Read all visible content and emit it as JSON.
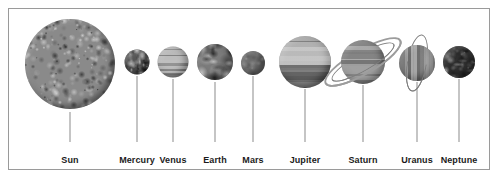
{
  "diagram": {
    "background_color": "#ffffff",
    "frame_color": "#9a9a9a",
    "label_color": "#1b1b1b",
    "leader_color": "#8c8c8c"
  },
  "bodies": [
    {
      "name": "Sun",
      "label": "Sun",
      "cx": 70,
      "cy": 64,
      "diameter": 90,
      "label_x": 70,
      "label_y": 155,
      "leader_x": 70,
      "leader_top": 112,
      "leader_height": 30,
      "base_color": "#8a8a8a",
      "texture": "granular",
      "rings": []
    },
    {
      "name": "Mercury",
      "label": "Mercury",
      "cx": 137,
      "cy": 62,
      "diameter": 25,
      "label_x": 137,
      "label_y": 155,
      "leader_x": 137,
      "leader_top": 76,
      "leader_height": 66,
      "base_color": "#565656",
      "texture": "cratered",
      "rings": []
    },
    {
      "name": "Venus",
      "label": "Venus",
      "cx": 173,
      "cy": 62,
      "diameter": 31,
      "label_x": 173,
      "label_y": 155,
      "leader_x": 173,
      "leader_top": 79,
      "leader_height": 63,
      "base_color": "#b4b4b4",
      "texture": "banded-light",
      "rings": []
    },
    {
      "name": "Earth",
      "label": "Earth",
      "cx": 215,
      "cy": 62,
      "diameter": 36,
      "label_x": 215,
      "label_y": 155,
      "leader_x": 215,
      "leader_top": 82,
      "leader_height": 60,
      "base_color": "#7b7b7b",
      "texture": "continents",
      "rings": []
    },
    {
      "name": "Mars",
      "label": "Mars",
      "cx": 253,
      "cy": 63,
      "diameter": 24,
      "label_x": 253,
      "label_y": 155,
      "leader_x": 253,
      "leader_top": 76,
      "leader_height": 66,
      "base_color": "#6d6d6d",
      "texture": "smooth",
      "rings": []
    },
    {
      "name": "Jupiter",
      "label": "Jupiter",
      "cx": 305,
      "cy": 62,
      "diameter": 52,
      "label_x": 305,
      "label_y": 155,
      "leader_x": 305,
      "leader_top": 89,
      "leader_height": 53,
      "base_color": "#9c9c9c",
      "texture": "banded-strong",
      "rings": []
    },
    {
      "name": "Saturn",
      "label": "Saturn",
      "cx": 363,
      "cy": 62,
      "diameter": 44,
      "label_x": 363,
      "label_y": 155,
      "leader_x": 363,
      "leader_top": 85,
      "leader_height": 57,
      "base_color": "#939393",
      "texture": "banded-soft",
      "rings": [
        {
          "rx": 42,
          "ry": 11,
          "rotation": -30,
          "thick": true
        },
        {
          "rx": 35,
          "ry": 8,
          "rotation": -30,
          "thick": false
        }
      ]
    },
    {
      "name": "Uranus",
      "label": "Uranus",
      "cx": 417,
      "cy": 63,
      "diameter": 36,
      "label_x": 417,
      "label_y": 155,
      "leader_x": 417,
      "leader_top": 82,
      "leader_height": 60,
      "base_color": "#8d8d8d",
      "texture": "banded-vertical",
      "rings": [
        {
          "rx": 9,
          "ry": 28,
          "rotation": 10,
          "thick": false
        }
      ]
    },
    {
      "name": "Neptune",
      "label": "Neptune",
      "cx": 459,
      "cy": 62,
      "diameter": 32,
      "label_x": 459,
      "label_y": 155,
      "leader_x": 459,
      "leader_top": 79,
      "leader_height": 63,
      "base_color": "#2f2f2f",
      "texture": "dark-mottled",
      "rings": []
    }
  ]
}
